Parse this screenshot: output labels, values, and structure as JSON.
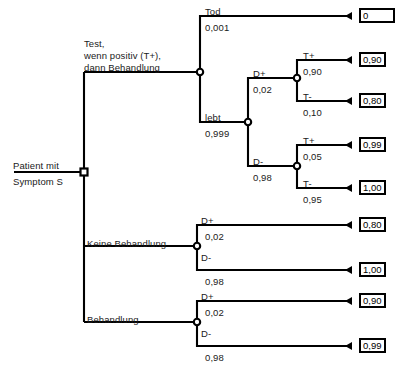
{
  "diagram": {
    "type": "decision-tree",
    "title_root": "Patient mit\nSymptom S",
    "root_label_line1": "Patient mit",
    "root_label_line2": "Symptom S",
    "caption": "",
    "nodes": {
      "root_decision": "square-decision-node",
      "chance": "circle-chance-node"
    },
    "strategies": [
      {
        "id": "test",
        "label_line1": "Test,",
        "label_line2": "wenn positiv (T+),",
        "label_line3": "dann Behandlung"
      },
      {
        "id": "keine-behandlung",
        "label": "Keine Behandlung"
      },
      {
        "id": "behandlung",
        "label": "Behandlung"
      }
    ],
    "branches": {
      "tod": {
        "label": "Tod",
        "prob": "0,001"
      },
      "lebt": {
        "label": "lebt",
        "prob": "0,999"
      },
      "test_dplus": {
        "label": "D+",
        "prob": "0,02"
      },
      "test_dminus": {
        "label": "D-",
        "prob": "0,98"
      },
      "dplus_tplus": {
        "label": "T+",
        "prob": "0,90"
      },
      "dplus_tminus": {
        "label": "T-",
        "prob": "0,10"
      },
      "dminus_tplus": {
        "label": "T+",
        "prob": "0,05"
      },
      "dminus_tminus": {
        "label": "T-",
        "prob": "0,95"
      },
      "keine_dplus": {
        "label": "D+",
        "prob": "0,02"
      },
      "keine_dminus": {
        "label": "D-",
        "prob": "0,98"
      },
      "beh_dplus": {
        "label": "D+",
        "prob": "0,02"
      },
      "beh_dminus": {
        "label": "D-",
        "prob": "0,98"
      }
    },
    "payoffs": {
      "tod": "0",
      "dplus_tplus": "0,90",
      "dplus_tminus": "0,80",
      "dminus_tplus": "0,99",
      "dminus_tminus": "1,00",
      "keine_dplus": "0,80",
      "keine_dminus": "1,00",
      "beh_dplus": "0,90",
      "beh_dminus": "0,99"
    },
    "colors": {
      "line": "#000000",
      "text": "#1a1a1a",
      "box_border": "#000000",
      "background": "#ffffff"
    }
  }
}
